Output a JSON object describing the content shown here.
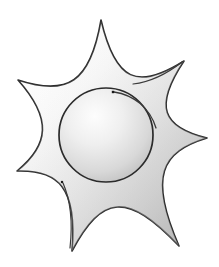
{
  "canvas": {
    "width": 219,
    "height": 267,
    "background": "#ffffff",
    "title": "Sun burst star drawing"
  },
  "artwork": {
    "name": "seven-pointed-sun-burst",
    "style": "hand-drawn sketch with grayscale gradient shading",
    "stroke_color": "#2b2b2b",
    "stroke_color_soft": "#555555",
    "stroke_width": 1.6,
    "fill_light": "#ffffff",
    "fill_mid": "#e8e8e8",
    "fill_dark": "#bdbdbd",
    "fill_shadow": "#9e9e9e"
  },
  "star": {
    "name": "outer-star-body",
    "center": {
      "x": 106,
      "y": 138
    },
    "point_count": 7,
    "outer_radius": 118,
    "inner_radius": 56,
    "tips": [
      {
        "label": "top-point",
        "x": 101,
        "y": 20
      },
      {
        "label": "upper-right-point",
        "x": 184,
        "y": 61
      },
      {
        "label": "right-point",
        "x": 207,
        "y": 138
      },
      {
        "label": "lower-right-point",
        "x": 179,
        "y": 246
      },
      {
        "label": "bottom-left-point",
        "x": 72,
        "y": 251
      },
      {
        "label": "lower-left-point",
        "x": 17,
        "y": 171
      },
      {
        "label": "upper-left-point",
        "x": 18,
        "y": 80
      }
    ],
    "path": "M 101 20 C 103 70 118 86 147 84 C 163 80 175 70 184 61 C 172 78 160 92 152 108 C 144 122 148 132 164 137 C 180 140 194 140 207 138 C 188 142 170 148 158 158 C 146 167 146 180 156 198 C 164 214 172 231 179 246 C 165 230 150 214 136 205 C 122 196 112 199 104 214 C 95 230 84 242 72 251 C 80 236 87 220 88 204 C 89 189 82 182 66 180 C 49 178 32 175 17 171 C 33 168 49 163 59 155 C 70 146 70 135 62 121 C 53 107 44 93 35 80 C 26 72 22 76 18 80 C 34 88 50 92 66 90 C 80 87 88 78 92 60 C 95 46 98 32 101 20 Z",
    "path_inner_reference": "seven concave-curved arms meeting at a central circular hub"
  },
  "core_circle": {
    "name": "central-disc",
    "center": {
      "x": 106,
      "y": 135
    },
    "radius": 47,
    "stroke_color": "#2b2b2b",
    "stroke_width": 1.7,
    "fill_light": "#f4f4f4",
    "fill_dark": "#b9b9b9"
  },
  "sketch_arcs": [
    {
      "name": "inner-highlight-arc",
      "description": "secondary pencil arc just outside upper-right of the central disc",
      "path": "M 114 92 C 134 95 150 108 156 128",
      "stroke_width": 1.3
    },
    {
      "name": "upper-right-sketch-arc",
      "description": "doubled contour line on the upper-right arm",
      "path": "M 133 84 C 150 82 168 73 182 62",
      "stroke_width": 1.2
    },
    {
      "name": "lower-left-sketch-arc",
      "description": "doubled contour line running down the lower-left arm",
      "path": "M 63 183 C 70 199 73 221 70 248",
      "stroke_width": 1.2
    }
  ],
  "dots": [
    {
      "name": "upper-dot",
      "x": 113,
      "y": 92,
      "size": 2.4,
      "color": "#1a1a1a"
    },
    {
      "name": "lower-left-dot",
      "x": 62,
      "y": 182,
      "size": 2.2,
      "color": "#1a1a1a"
    }
  ]
}
